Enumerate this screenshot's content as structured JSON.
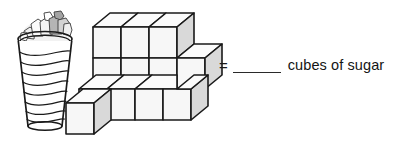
{
  "figure": {
    "equation": {
      "equals_symbol": "=",
      "blank_value": "",
      "unit_label": "cubes of sugar"
    },
    "cup": {
      "name": "cup-of-sugar",
      "description": "tapered ribbed cup filled with sugar cubes",
      "rib_count": 8,
      "fill_items": 9
    },
    "cube_stack": {
      "name": "sugar-cube-stack",
      "description": "isometric stack of sugar cubes",
      "visible_cubes": 11,
      "detached_cubes": 1
    },
    "colors": {
      "outline": "#1a1a1a",
      "cube_top_face": "#fbfbfb",
      "cube_front_face": "#f7f7f7",
      "cube_side_face": "#d9d9d9",
      "cup_body": "#ffffff",
      "sugar_light": "#e8e8e8",
      "sugar_dark": "#a8a8a8",
      "text": "#141414",
      "background": "#ffffff"
    }
  }
}
